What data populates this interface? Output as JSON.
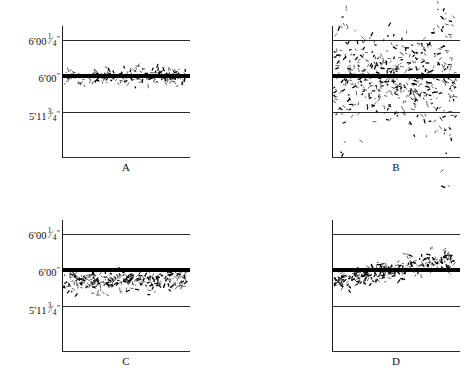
{
  "figure": {
    "background_color": "#ffffff",
    "ink_color": "#000000",
    "grid_color": "#2b2b2b",
    "panel_count": 4
  },
  "axis": {
    "labels": [
      {
        "id": "upper",
        "text": "6'00 1/4\"",
        "whole": "6'00",
        "frac_num": "1",
        "frac_den": "4",
        "unit": "\""
      },
      {
        "id": "target",
        "text": "6'00\"",
        "whole": "6'00",
        "frac_num": "",
        "frac_den": "",
        "unit": "\""
      },
      {
        "id": "lower",
        "text": "5'11 3/4\"",
        "whole": "5'11",
        "frac_num": "3",
        "frac_den": "4",
        "unit": "\""
      }
    ]
  },
  "panels": [
    {
      "id": "A",
      "letter": "A",
      "position": "top-left",
      "description": "tight scatter centered on target line",
      "pattern": "precise-and-accurate"
    },
    {
      "id": "B",
      "letter": "B",
      "position": "top-right",
      "description": "wide scatter centered on target line, spread past both gridlines",
      "pattern": "imprecise-but-accurate"
    },
    {
      "id": "C",
      "letter": "C",
      "position": "bottom-left",
      "description": "tight scatter sitting entirely below the target line",
      "pattern": "precise-but-biased-low"
    },
    {
      "id": "D",
      "letter": "D",
      "position": "bottom-right",
      "description": "scatter drifting upward from below the target line to above it",
      "pattern": "drifting-trend"
    }
  ],
  "chart_data": {
    "type": "scatter",
    "title": "",
    "xlabel": "",
    "ylabel": "",
    "ytick_labels": [
      "6'00 1/4\"",
      "6'00\"",
      "5'11 3/4\""
    ],
    "ytick_values": [
      72.25,
      72.0,
      71.75
    ],
    "ylim": [
      71.55,
      72.45
    ],
    "xlim": [
      0,
      1
    ],
    "grid": true,
    "legend": false,
    "target_value": 72.0,
    "units": "inches",
    "series": [
      {
        "name": "A",
        "panel": "A",
        "mean": 72.0,
        "spread": 0.03,
        "drift": 0.0,
        "n": 220,
        "values_summary": "centered on 72.00 in, band roughly 71.97 to 72.03 in"
      },
      {
        "name": "B",
        "panel": "B",
        "mean": 72.0,
        "spread": 0.26,
        "drift": 0.0,
        "n": 520,
        "values_summary": "centered on 72.00 in, spread roughly 71.66 to 72.38 in"
      },
      {
        "name": "C",
        "panel": "C",
        "mean": 71.93,
        "spread": 0.035,
        "drift": 0.0,
        "n": 300,
        "values_summary": "offset low, band roughly 71.88 to 71.98 in"
      },
      {
        "name": "D",
        "panel": "D",
        "mean": 72.0,
        "spread": 0.035,
        "drift": 0.16,
        "n": 300,
        "values_summary": "rises from about 71.90 in at left to about 72.07 in at right"
      }
    ]
  }
}
